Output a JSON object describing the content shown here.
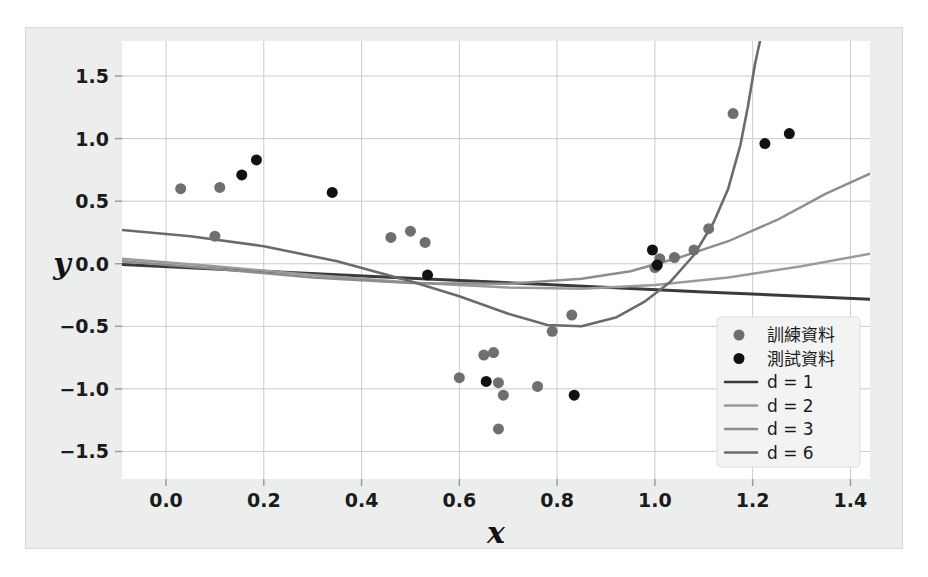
{
  "figure": {
    "panel_bg": "#eceded",
    "plot_bg": "#ffffff",
    "grid_color": "#c9cbcc",
    "text_color": "#1b1b1b"
  },
  "chart_data": {
    "type": "scatter",
    "title": "",
    "xlabel": "x",
    "ylabel": "y",
    "xlim": [
      -0.09,
      1.44
    ],
    "ylim": [
      -1.72,
      1.78
    ],
    "xticks": [
      0.0,
      0.2,
      0.4,
      0.6,
      0.8,
      1.0,
      1.2,
      1.4
    ],
    "xtick_labels": [
      "0.0",
      "0.2",
      "0.4",
      "0.6",
      "0.8",
      "1.0",
      "1.2",
      "1.4"
    ],
    "yticks": [
      -1.5,
      -1.0,
      -0.5,
      0.0,
      0.5,
      1.0,
      1.5
    ],
    "ytick_labels": [
      "−1.5",
      "−1.0",
      "−0.5",
      "0.0",
      "0.5",
      "1.0",
      "1.5"
    ],
    "grid": true,
    "legend_position": "lower-right",
    "series": [
      {
        "name": "訓練資料",
        "kind": "scatter",
        "marker": "circle",
        "color": "#6f6f6f",
        "marker_size": 11,
        "points": [
          [
            0.03,
            0.6
          ],
          [
            0.1,
            0.22
          ],
          [
            0.11,
            0.61
          ],
          [
            0.46,
            0.21
          ],
          [
            0.5,
            0.26
          ],
          [
            0.53,
            0.17
          ],
          [
            0.6,
            -0.91
          ],
          [
            0.65,
            -0.73
          ],
          [
            0.67,
            -0.71
          ],
          [
            0.68,
            -0.95
          ],
          [
            0.69,
            -1.05
          ],
          [
            0.68,
            -1.32
          ],
          [
            0.76,
            -0.98
          ],
          [
            0.79,
            -0.54
          ],
          [
            0.83,
            -0.41
          ],
          [
            1.0,
            -0.03
          ],
          [
            1.01,
            0.04
          ],
          [
            1.04,
            0.05
          ],
          [
            1.08,
            0.11
          ],
          [
            1.11,
            0.28
          ],
          [
            1.16,
            1.2
          ]
        ]
      },
      {
        "name": "測試資料",
        "kind": "scatter",
        "marker": "circle",
        "color": "#111111",
        "marker_size": 11,
        "points": [
          [
            0.155,
            0.71
          ],
          [
            0.185,
            0.83
          ],
          [
            0.34,
            0.57
          ],
          [
            0.535,
            -0.09
          ],
          [
            0.655,
            -0.94
          ],
          [
            0.835,
            -1.05
          ],
          [
            0.995,
            0.11
          ],
          [
            1.005,
            -0.01
          ],
          [
            1.225,
            0.96
          ],
          [
            1.275,
            1.04
          ]
        ]
      },
      {
        "name": "d = 1",
        "kind": "line",
        "color": "#3a3a3a",
        "width": 3.0,
        "degree": 1,
        "points": [
          [
            -0.09,
            -0.005
          ],
          [
            0.2,
            -0.06
          ],
          [
            0.5,
            -0.115
          ],
          [
            0.8,
            -0.17
          ],
          [
            1.1,
            -0.225
          ],
          [
            1.44,
            -0.283
          ]
        ]
      },
      {
        "name": "d = 2",
        "kind": "line",
        "color": "#9a9a9a",
        "width": 2.4,
        "degree": 2,
        "points": [
          [
            -0.09,
            0.04
          ],
          [
            0.1,
            -0.02
          ],
          [
            0.3,
            -0.09
          ],
          [
            0.5,
            -0.15
          ],
          [
            0.7,
            -0.19
          ],
          [
            0.85,
            -0.2
          ],
          [
            1.0,
            -0.17
          ],
          [
            1.15,
            -0.11
          ],
          [
            1.3,
            -0.02
          ],
          [
            1.44,
            0.08
          ]
        ]
      },
      {
        "name": "d = 3",
        "kind": "line",
        "color": "#8d8d8d",
        "width": 2.4,
        "degree": 3,
        "points": [
          [
            -0.09,
            0.02
          ],
          [
            0.1,
            -0.04
          ],
          [
            0.3,
            -0.11
          ],
          [
            0.5,
            -0.155
          ],
          [
            0.7,
            -0.16
          ],
          [
            0.85,
            -0.12
          ],
          [
            0.95,
            -0.06
          ],
          [
            1.05,
            0.05
          ],
          [
            1.15,
            0.18
          ],
          [
            1.25,
            0.35
          ],
          [
            1.35,
            0.56
          ],
          [
            1.44,
            0.72
          ]
        ]
      },
      {
        "name": "d = 6",
        "kind": "line",
        "color": "#6b6b6b",
        "width": 2.6,
        "degree": 6,
        "points": [
          [
            -0.09,
            0.27
          ],
          [
            0.05,
            0.22
          ],
          [
            0.2,
            0.14
          ],
          [
            0.35,
            0.02
          ],
          [
            0.5,
            -0.14
          ],
          [
            0.6,
            -0.26
          ],
          [
            0.7,
            -0.4
          ],
          [
            0.78,
            -0.49
          ],
          [
            0.85,
            -0.5
          ],
          [
            0.92,
            -0.43
          ],
          [
            0.98,
            -0.3
          ],
          [
            1.03,
            -0.15
          ],
          [
            1.08,
            0.07
          ],
          [
            1.12,
            0.33
          ],
          [
            1.15,
            0.6
          ],
          [
            1.175,
            0.95
          ],
          [
            1.19,
            1.25
          ],
          [
            1.205,
            1.6
          ],
          [
            1.215,
            1.78
          ]
        ]
      }
    ]
  },
  "legend": {
    "entries": [
      {
        "label": "訓練資料",
        "type": "marker",
        "color": "#6f6f6f"
      },
      {
        "label": "測試資料",
        "type": "marker",
        "color": "#111111"
      },
      {
        "label": "d = 1",
        "type": "line",
        "color": "#3a3a3a"
      },
      {
        "label": "d = 2",
        "type": "line",
        "color": "#9a9a9a"
      },
      {
        "label": "d = 3",
        "type": "line",
        "color": "#8d8d8d"
      },
      {
        "label": "d = 6",
        "type": "line",
        "color": "#6b6b6b"
      }
    ]
  }
}
